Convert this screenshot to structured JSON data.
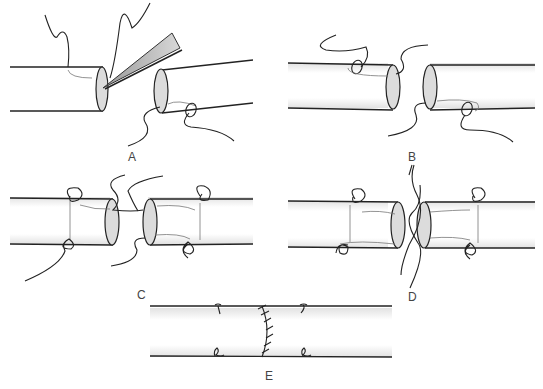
{
  "figure": {
    "panels": [
      {
        "id": "A",
        "label": "A",
        "description": "Forceps dilating vessel end; stay suture placed"
      },
      {
        "id": "B",
        "label": "B",
        "description": "Two vessel ends with initial stay sutures"
      },
      {
        "id": "C",
        "label": "C",
        "description": "Vessel ends approximated with stay sutures tied"
      },
      {
        "id": "D",
        "label": "D",
        "description": "Ends brought together, sutures crossing"
      },
      {
        "id": "E",
        "label": "E",
        "description": "Completed anastomosis with interrupted sutures"
      }
    ],
    "colors": {
      "line": "#222222",
      "vessel_shade": "#e6e6e6",
      "face_fill": "#dcdcdc",
      "label": "#444444"
    }
  }
}
